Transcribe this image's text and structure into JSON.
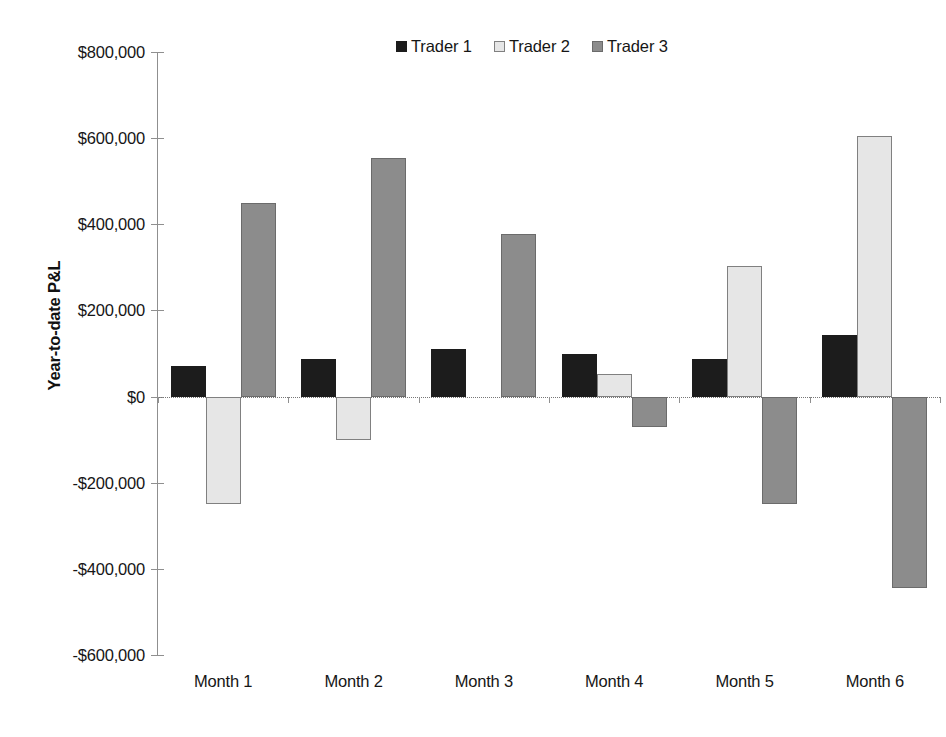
{
  "chart_data": {
    "type": "bar",
    "title": "",
    "subtitle": "",
    "xlabel": "",
    "ylabel": "Year-to-date P&L",
    "categories": [
      "Month 1",
      "Month 2",
      "Month 3",
      "Month 4",
      "Month 5",
      "Month 6"
    ],
    "series": [
      {
        "name": "Trader 1",
        "color": "#1c1c1c",
        "values": [
          70000,
          87000,
          110000,
          100000,
          87000,
          143000
        ]
      },
      {
        "name": "Trader 2",
        "color": "#e6e6e6",
        "values": [
          -250000,
          -100000,
          0,
          53000,
          303000,
          605000
        ]
      },
      {
        "name": "Trader 3",
        "color": "#8c8c8c",
        "values": [
          450000,
          553000,
          378000,
          -70000,
          -250000,
          -445000
        ]
      }
    ],
    "ylim": [
      -600000,
      800000
    ],
    "ytick_values": [
      800000,
      600000,
      400000,
      200000,
      0,
      -200000,
      -400000,
      -600000
    ],
    "ytick_labels": [
      "$800,000",
      "$600,000",
      "$400,000",
      "$200,000",
      "$0",
      "-$200,000",
      "-$400,000",
      "-$600,000"
    ],
    "grid": false,
    "zero_line": true,
    "legend_position": "top-center"
  },
  "legend": {
    "entries": [
      {
        "label": "Trader 1",
        "swatch": "#1c1c1c",
        "border": "#1c1c1c"
      },
      {
        "label": "Trader 2",
        "swatch": "#e6e6e6",
        "border": "#808080"
      },
      {
        "label": "Trader 3",
        "swatch": "#8c8c8c",
        "border": "#6b6b6b"
      }
    ]
  },
  "axes": {
    "y_title": "Year-to-date P&L"
  }
}
